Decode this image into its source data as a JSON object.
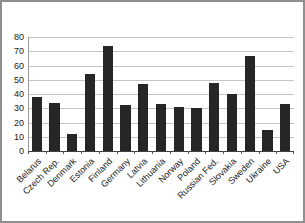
{
  "chart_data": {
    "type": "bar",
    "title": "",
    "xlabel": "",
    "ylabel": "",
    "categories": [
      "Belarus",
      "Czech Rep.",
      "Denmark",
      "Estonia",
      "Finland",
      "Germany",
      "Latvia",
      "Lithuania",
      "Norway",
      "Poland",
      "Russian Fed.",
      "Slovakia",
      "Sweden",
      "Ukraine",
      "USA"
    ],
    "values": [
      38,
      34,
      12,
      54,
      74,
      32,
      47,
      33,
      31,
      30,
      48,
      40,
      67,
      15,
      33
    ],
    "ylim": [
      0,
      80
    ],
    "ytick_step": 10,
    "ytick_labels": [
      "0",
      "10",
      "20",
      "30",
      "40",
      "50",
      "60",
      "70",
      "80"
    ],
    "grid": true,
    "legend": false,
    "colors": {
      "bar": "#262626",
      "gridline": "#c4c4c4",
      "y_axis": "#9a9a9a",
      "x_axis": "#3f3f3f",
      "tick": "#555555",
      "label_text": "#1a1a1a",
      "frame_border": "#8f8f8f",
      "background": "#ffffff"
    }
  }
}
